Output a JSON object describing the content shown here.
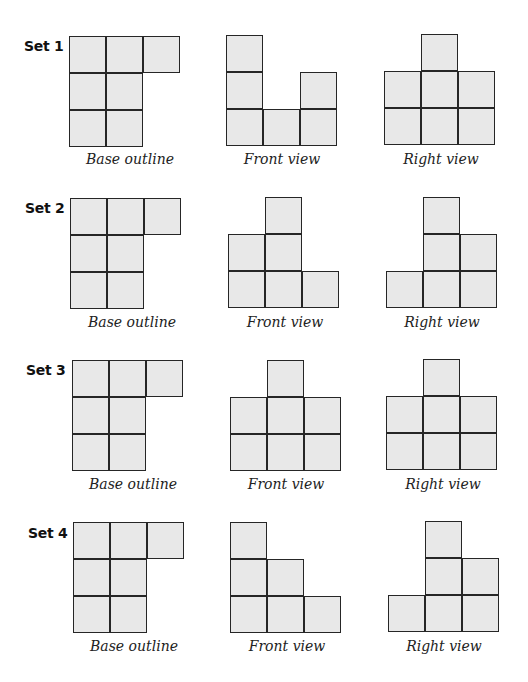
{
  "style": {
    "cell_fill": "#e8e8e8",
    "cell_stroke": "#262626",
    "cell_size": 37
  },
  "sets": [
    {
      "label": "Set 1",
      "base": {
        "caption": "Base outline",
        "rows": [
          3,
          2,
          2
        ]
      },
      "front": {
        "caption": "Front view",
        "heights": [
          3,
          1,
          2
        ]
      },
      "right": {
        "caption": "Right view",
        "heights": [
          2,
          3,
          2
        ]
      }
    },
    {
      "label": "Set 2",
      "base": {
        "caption": "Base outline",
        "rows": [
          3,
          2,
          2
        ]
      },
      "front": {
        "caption": "Front view",
        "heights": [
          2,
          3,
          1
        ]
      },
      "right": {
        "caption": "Right view",
        "heights": [
          1,
          3,
          2
        ]
      }
    },
    {
      "label": "Set 3",
      "base": {
        "caption": "Base outline",
        "rows": [
          3,
          2,
          2
        ]
      },
      "front": {
        "caption": "Front view",
        "heights": [
          2,
          3,
          2
        ]
      },
      "right": {
        "caption": "Right view",
        "heights": [
          2,
          3,
          2
        ]
      }
    },
    {
      "label": "Set 4",
      "base": {
        "caption": "Base outline",
        "rows": [
          3,
          2,
          2
        ]
      },
      "front": {
        "caption": "Front view",
        "heights": [
          3,
          2,
          1
        ]
      },
      "right": {
        "caption": "Right view",
        "heights": [
          1,
          3,
          2
        ]
      }
    }
  ]
}
